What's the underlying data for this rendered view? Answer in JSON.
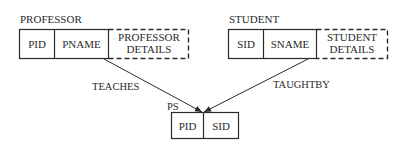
{
  "diagram": {
    "entities": [
      {
        "id": "professor",
        "title": "PROFESSOR",
        "fields": [
          "PID",
          "PNAME"
        ],
        "details": [
          "PROFESSOR",
          "DETAILS"
        ]
      },
      {
        "id": "student",
        "title": "STUDENT",
        "fields": [
          "SID",
          "SNAME"
        ],
        "details": [
          "STUDENT",
          "DETAILS"
        ]
      },
      {
        "id": "ps",
        "title": "PS",
        "fields": [
          "PID",
          "SID"
        ]
      }
    ],
    "relationships": [
      {
        "label": "TEACHES",
        "from": "professor",
        "to": "ps"
      },
      {
        "label": "TAUGHTBY",
        "from": "student",
        "to": "ps"
      }
    ],
    "colors": {
      "line": "#2a2a2a",
      "background": "#ffffff"
    }
  }
}
